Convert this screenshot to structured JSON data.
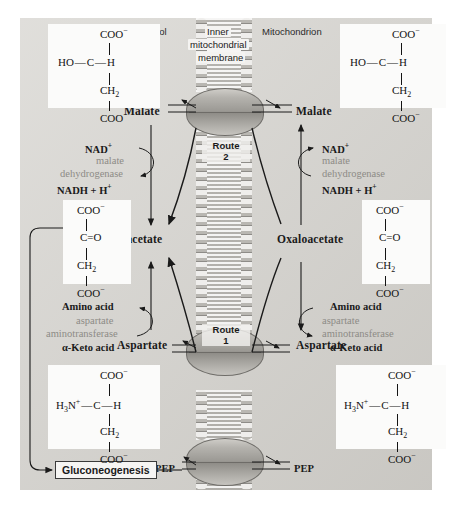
{
  "figure": {
    "regions": {
      "left": "Cytosol",
      "right": "Mitochondrion"
    },
    "membrane_label": [
      "Inner",
      "mitochondrial",
      "membrane"
    ],
    "routes": [
      {
        "name": "Route",
        "number": "2"
      },
      {
        "name": "Route",
        "number": "1"
      }
    ]
  },
  "cytosol": {
    "malate_label": "Malate",
    "oxaloacetate_label": "Oxaloacetate",
    "aspartate_label": "Aspartate",
    "pep_label": "PEP",
    "gluconeogenesis_label": "Gluconeogenesis",
    "mdh": {
      "substrate_cofactor": "NAD",
      "substrate_charge": "+",
      "enzyme_line1": "malate",
      "enzyme_line2": "dehydrogenase",
      "product_cofactor": "NADH + H",
      "product_charge": "+"
    },
    "ast": {
      "substrate": "Amino acid",
      "enzyme_line1": "aspartate",
      "enzyme_line2": "aminotransferase",
      "product": "α-Keto acid"
    }
  },
  "mitochondrion": {
    "malate_label": "Malate",
    "oxaloacetate_label": "Oxaloacetate",
    "aspartate_label": "Aspartate",
    "pep_label": "PEP",
    "mdh": {
      "substrate_cofactor": "NAD",
      "substrate_charge": "+",
      "enzyme_line1": "malate",
      "enzyme_line2": "dehydrogenase",
      "product_cofactor": "NADH + H",
      "product_charge": "+"
    },
    "ast": {
      "substrate": "Amino acid",
      "enzyme_line1": "aspartate",
      "enzyme_line2": "aminotransferase",
      "product": "α-Keto acid"
    }
  },
  "structures": {
    "malate": {
      "name": "malate",
      "top": "COO",
      "top_charge": "−",
      "c2_left": "HO",
      "c2_center": "C",
      "c2_right": "H",
      "c3": "CH",
      "c3_sub": "2",
      "bottom": "COO",
      "bottom_charge": "−"
    },
    "oxaloacetate": {
      "name": "oxaloacetate",
      "top": "COO",
      "top_charge": "−",
      "c2": "C",
      "c2_double": "=",
      "c2_o": "O",
      "c3": "CH",
      "c3_sub": "2",
      "bottom": "COO",
      "bottom_charge": "−"
    },
    "aspartate": {
      "name": "aspartate",
      "top": "COO",
      "top_charge": "−",
      "c2_left": "H",
      "c2_left_sub": "3",
      "c2_left_n": "N",
      "c2_left_charge": "+",
      "c2_center": "C",
      "c2_right": "H",
      "c3": "CH",
      "c3_sub": "2",
      "bottom": "COO",
      "bottom_charge": "−"
    }
  },
  "colors": {
    "panel_bg": "#d4d2cd",
    "enzyme_text": "#8d8b86",
    "text": "#1a1a1a",
    "membrane_head": "#b9b7b2",
    "transporter": "#9b9994"
  }
}
